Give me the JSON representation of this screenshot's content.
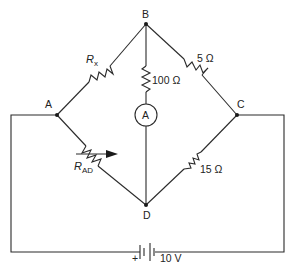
{
  "diagram": {
    "type": "wheatstone-bridge-circuit",
    "nodes": {
      "A": "A",
      "B": "B",
      "C": "C",
      "D": "D"
    },
    "components": {
      "r_x": {
        "symbol": "R",
        "subscript": "x",
        "between": "A-B"
      },
      "r_bc": {
        "label": "5 Ω",
        "between": "B-C"
      },
      "r_bd": {
        "label": "100 Ω",
        "between": "B-D (in series with ammeter)"
      },
      "ammeter": {
        "label": "A",
        "between": "B-D"
      },
      "r_ad": {
        "symbol": "R",
        "subscript": "AD",
        "variable": true,
        "between": "A-D"
      },
      "r_cd": {
        "label": "15 Ω",
        "between": "C-D"
      },
      "battery": {
        "label": "10 V",
        "polarity": "+",
        "between": "A-C (external loop)"
      }
    },
    "colors": {
      "line": "#2a2a2a",
      "background": "#ffffff"
    }
  }
}
